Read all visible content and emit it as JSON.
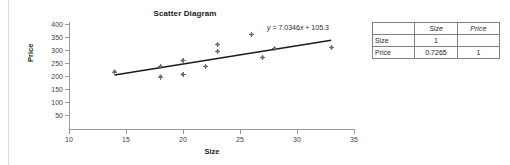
{
  "chart_data": {
    "type": "scatter",
    "title": "Scatter Diagram",
    "xlabel": "Size",
    "ylabel": "Price",
    "xlim": [
      10,
      35
    ],
    "ylim": [
      0,
      400
    ],
    "xticks": [
      10,
      15,
      20,
      25,
      30,
      35
    ],
    "yticks": [
      50,
      100,
      150,
      200,
      250,
      300,
      350,
      400
    ],
    "grid": false,
    "legend": "none",
    "points": [
      {
        "x": 14,
        "y": 215
      },
      {
        "x": 18,
        "y": 237
      },
      {
        "x": 18,
        "y": 196
      },
      {
        "x": 20,
        "y": 258
      },
      {
        "x": 20,
        "y": 205
      },
      {
        "x": 22,
        "y": 237
      },
      {
        "x": 23,
        "y": 320
      },
      {
        "x": 23,
        "y": 293
      },
      {
        "x": 26,
        "y": 358
      },
      {
        "x": 27,
        "y": 270
      },
      {
        "x": 28,
        "y": 307
      },
      {
        "x": 33,
        "y": 310
      }
    ],
    "trendline": {
      "slope": 7.0346,
      "intercept": 105.3,
      "equation": "y = 7.0346x + 105.3",
      "equation_y": "y",
      "equation_rest": " = 7.0346",
      "equation_x": "x",
      "equation_tail": " + 105.3",
      "x_start": 14,
      "x_end": 33
    },
    "marker_color": "#6e6e6e",
    "line_color": "#1a1a1a",
    "axis_color": "#9a9a9a"
  },
  "correlation_table": {
    "caption": "",
    "column_headers": [
      "",
      "Size",
      "Price"
    ],
    "rows": [
      {
        "label": "Size",
        "values": [
          "1",
          ""
        ]
      },
      {
        "label": "Price",
        "values": [
          "0.7265",
          "1"
        ]
      }
    ]
  }
}
